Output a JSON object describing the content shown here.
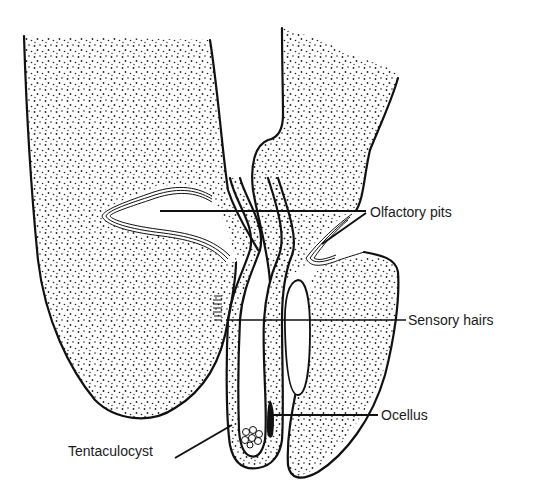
{
  "figure": {
    "type": "anatomical line drawing (stippled)",
    "colors": {
      "ink": "#111111",
      "background": "#ffffff",
      "stipple": "#222222"
    }
  },
  "labels": {
    "olfactory_pits": "Olfactory pits",
    "sensory_hairs": "Sensory hairs",
    "ocellus": "Ocellus",
    "tentaculocyst": "Tentaculocyst"
  }
}
